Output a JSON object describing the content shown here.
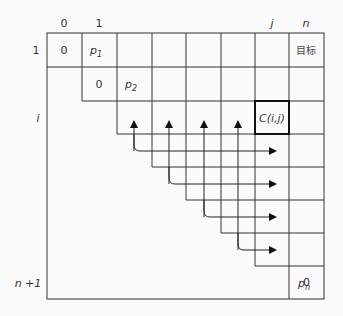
{
  "diagram": {
    "type": "dynamic-programming-table",
    "column_labels": {
      "c0": "0",
      "c1": "1",
      "cj": "j",
      "cn": "n"
    },
    "row_labels": {
      "r1": "1",
      "ri": "i",
      "rn1": "n +1"
    },
    "cells": {
      "r1c0": "0",
      "r1c1": "p",
      "r1c1_sub": "1",
      "r1cn": "目标",
      "r2c1": "0",
      "r2c2": "p",
      "r2c2_sub": "2",
      "ricj": "C(i,j)",
      "rnpn": "p",
      "rnpn_sub": "n",
      "rn1cn": "0"
    },
    "arrows": {
      "up_arrow_count": 4,
      "right_arrow_count": 4,
      "description": "C(i,j) depends on entries in row i (left of j) and column j (below i)"
    },
    "colors": {
      "line": "#333333",
      "background": "#fbfbfb"
    }
  }
}
